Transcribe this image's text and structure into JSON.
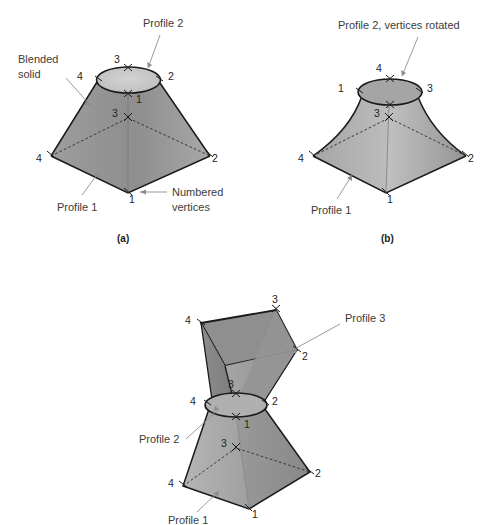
{
  "figure": {
    "background_color": "#ffffff",
    "outline_color": "#1a1a1a",
    "leader_color": "#8d8d8d",
    "label_color": "#3b3b3b",
    "fills": {
      "face_dark": "#8a8a8a",
      "face_mid": "#9a9a9a",
      "face_light": "#b4b4b4",
      "face_lighter": "#c2c2c2",
      "ellipse_top": "#c8c8c8",
      "ellipse_mid": "#bdbdbd",
      "quad_top": "#8f8f8f"
    }
  },
  "panels": [
    {
      "id": "a",
      "caption": "(a)",
      "annotations": [
        {
          "name": "profile-2",
          "lines": [
            "Profile 2"
          ]
        },
        {
          "name": "blended-solid",
          "lines": [
            "Blended",
            "solid"
          ]
        },
        {
          "name": "profile-1",
          "lines": [
            "Profile 1"
          ]
        },
        {
          "name": "numbered-vertices",
          "lines": [
            "Numbered",
            "vertices"
          ]
        }
      ],
      "top_profile_vertices": [
        {
          "num": "3",
          "pos": "top"
        },
        {
          "num": "2",
          "pos": "right"
        },
        {
          "num": "1",
          "pos": "bottom"
        },
        {
          "num": "4",
          "pos": "left"
        }
      ],
      "base_profile_vertices": [
        {
          "num": "3",
          "pos": "top"
        },
        {
          "num": "2",
          "pos": "right"
        },
        {
          "num": "1",
          "pos": "bottom"
        },
        {
          "num": "4",
          "pos": "left"
        }
      ]
    },
    {
      "id": "b",
      "caption": "(b)",
      "annotations": [
        {
          "name": "profile-2-rotated",
          "lines": [
            "Profile 2, vertices rotated"
          ]
        },
        {
          "name": "profile-1",
          "lines": [
            "Profile 1"
          ]
        }
      ],
      "top_profile_vertices": [
        {
          "num": "4",
          "pos": "top"
        },
        {
          "num": "3",
          "pos": "right"
        },
        {
          "num": "1",
          "pos": "left"
        }
      ],
      "base_profile_vertices": [
        {
          "num": "3",
          "pos": "top"
        },
        {
          "num": "2",
          "pos": "right"
        },
        {
          "num": "1",
          "pos": "bottom"
        },
        {
          "num": "4",
          "pos": "left"
        }
      ]
    },
    {
      "id": "c",
      "caption": "",
      "annotations": [
        {
          "name": "profile-3",
          "lines": [
            "Profile 3"
          ]
        },
        {
          "name": "profile-2",
          "lines": [
            "Profile 2"
          ]
        },
        {
          "name": "profile-1",
          "lines": [
            "Profile 1"
          ]
        }
      ],
      "top_profile_vertices": [
        {
          "num": "3",
          "pos": "top-right"
        },
        {
          "num": "2",
          "pos": "right"
        },
        {
          "num": "4",
          "pos": "left"
        }
      ],
      "mid_profile_vertices": [
        {
          "num": "3",
          "pos": "top"
        },
        {
          "num": "2",
          "pos": "right"
        },
        {
          "num": "1",
          "pos": "bottom"
        },
        {
          "num": "4",
          "pos": "left"
        }
      ],
      "base_profile_vertices": [
        {
          "num": "3",
          "pos": "top"
        },
        {
          "num": "2",
          "pos": "right"
        },
        {
          "num": "1",
          "pos": "bottom"
        },
        {
          "num": "4",
          "pos": "left"
        }
      ]
    }
  ],
  "labels": {
    "a_profile2": "Profile 2",
    "a_blended_1": "Blended",
    "a_blended_2": "solid",
    "a_profile1": "Profile 1",
    "a_numbered_1": "Numbered",
    "a_numbered_2": "vertices",
    "a_caption": "(a)",
    "b_profile2_rotated": "Profile 2, vertices rotated",
    "b_profile1": "Profile 1",
    "b_caption": "(b)",
    "c_profile3": "Profile 3",
    "c_profile2": "Profile 2",
    "c_profile1": "Profile 1"
  },
  "vertex_numbers": {
    "a_top_3": "3",
    "a_top_4": "4",
    "a_top_2": "2",
    "a_top_1": "1",
    "a_base_3": "3",
    "a_base_4": "4",
    "a_base_2": "2",
    "a_base_1": "1",
    "b_top_4": "4",
    "b_top_1": "1",
    "b_top_3": "3",
    "b_base_3": "3",
    "b_base_4": "4",
    "b_base_2": "2",
    "b_base_1": "1",
    "c_top_3": "3",
    "c_top_4": "4",
    "c_top_2": "2",
    "c_mid_3": "3",
    "c_mid_4": "4",
    "c_mid_2": "2",
    "c_mid_1": "1",
    "c_base_3": "3",
    "c_base_4": "4",
    "c_base_2": "2",
    "c_base_1": "1"
  }
}
